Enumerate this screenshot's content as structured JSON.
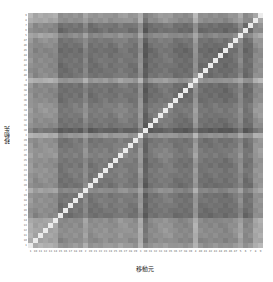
{
  "chart_data": {
    "type": "heatmap",
    "title": "",
    "xlabel": "移動元",
    "ylabel": "移動先",
    "categories": [
      "1",
      "10",
      "11",
      "12",
      "13",
      "14",
      "15",
      "16",
      "17",
      "18",
      "19",
      "2",
      "20",
      "21",
      "22",
      "23",
      "24",
      "25",
      "26",
      "27",
      "28",
      "29",
      "3",
      "30",
      "31",
      "32",
      "33",
      "34",
      "35",
      "36",
      "37",
      "38",
      "39",
      "4",
      "40",
      "41",
      "42",
      "43",
      "44",
      "45",
      "46",
      "47",
      "5",
      "6",
      "7",
      "8",
      "9"
    ],
    "y_order": "bottom-to-top",
    "colormap": "grayscale (dark = low, light = high)",
    "value_range": [
      0,
      1
    ],
    "diagonal_value": 1.0,
    "row_profile": [
      0.72,
      0.62,
      0.66,
      0.66,
      0.64,
      0.64,
      0.42,
      0.44,
      0.46,
      0.48,
      0.46,
      0.62,
      0.44,
      0.46,
      0.48,
      0.5,
      0.46,
      0.48,
      0.54,
      0.52,
      0.48,
      0.46,
      0.7,
      0.28,
      0.44,
      0.46,
      0.5,
      0.52,
      0.5,
      0.44,
      0.42,
      0.42,
      0.44,
      0.72,
      0.44,
      0.42,
      0.42,
      0.44,
      0.42,
      0.4,
      0.44,
      0.48,
      0.62,
      0.4,
      0.44,
      0.66,
      0.7
    ]
  },
  "axes": {
    "x_label": "移動元",
    "y_label": "移動先"
  }
}
